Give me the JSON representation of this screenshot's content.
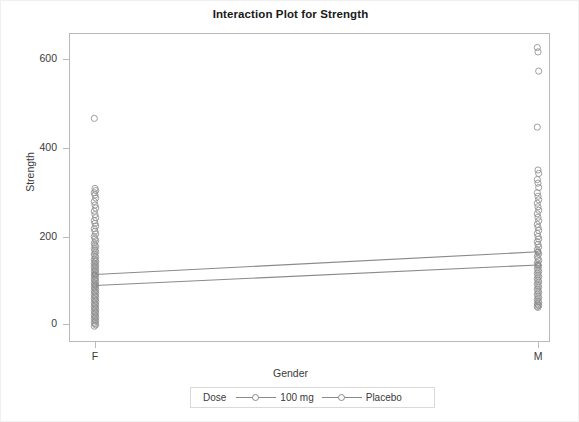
{
  "chart_data": {
    "type": "scatter",
    "title": "Interaction Plot for Strength",
    "xlabel": "Gender",
    "ylabel": "Strength",
    "categories": [
      "F",
      "M"
    ],
    "xticklabels": [
      "F",
      "M"
    ],
    "yticklabels": [
      "0",
      "200",
      "400",
      "600"
    ],
    "yticks": [
      0,
      200,
      400,
      600
    ],
    "ylim": [
      -40,
      660
    ],
    "grid": false,
    "legend": {
      "title": "Dose",
      "position": "bottom",
      "entries": [
        {
          "name": "100 mg",
          "marker": "open-circle",
          "color": "#8a8a8a"
        },
        {
          "name": "Placebo",
          "marker": "open-circle",
          "color": "#8a8a8a"
        }
      ]
    },
    "series": [
      {
        "name": "100 mg",
        "x": [
          "F",
          "M"
        ],
        "values": [
          113,
          165
        ],
        "marker_color": "#8a8a8a",
        "line_color": "#8a8a8a"
      },
      {
        "name": "Placebo",
        "x": [
          "F",
          "M"
        ],
        "values": [
          88,
          135
        ],
        "marker_color": "#8a8a8a",
        "line_color": "#8a8a8a"
      }
    ],
    "scatter_points": {
      "F": [
        470,
        310,
        305,
        300,
        295,
        288,
        280,
        272,
        265,
        258,
        250,
        243,
        236,
        230,
        224,
        218,
        212,
        206,
        200,
        195,
        190,
        185,
        180,
        176,
        172,
        168,
        164,
        160,
        156,
        152,
        148,
        145,
        142,
        139,
        136,
        133,
        130,
        127,
        124,
        121,
        118,
        115,
        112,
        109,
        106,
        103,
        100,
        97,
        94,
        91,
        88,
        85,
        82,
        79,
        76,
        73,
        70,
        67,
        64,
        61,
        58,
        55,
        52,
        49,
        46,
        43,
        40,
        37,
        34,
        31,
        28,
        25,
        22,
        19,
        16,
        13,
        10,
        7,
        4,
        1,
        -2,
        -5
      ],
      "M": [
        632,
        622,
        578,
        450,
        352,
        344,
        330,
        322,
        312,
        300,
        292,
        284,
        276,
        268,
        260,
        252,
        244,
        236,
        228,
        221,
        214,
        207,
        200,
        194,
        188,
        182,
        176,
        170,
        165,
        160,
        155,
        150,
        145,
        140,
        136,
        132,
        128,
        124,
        120,
        116,
        112,
        108,
        104,
        100,
        96,
        92,
        88,
        84,
        80,
        76,
        72,
        68,
        64,
        60,
        56,
        52,
        49,
        46,
        44,
        42,
        40,
        38
      ]
    }
  },
  "chart": {
    "title": "Interaction Plot for Strength",
    "y_axis_title": "Strength",
    "x_axis_title": "Gender",
    "y_ticks": [
      "600",
      "400",
      "200",
      "0"
    ],
    "x_ticks": [
      "F",
      "M"
    ],
    "legend_title": "Dose",
    "legend_item_1": "100 mg",
    "legend_item_2": "Placebo"
  }
}
